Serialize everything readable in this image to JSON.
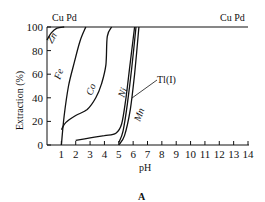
{
  "chart_data": {
    "type": "line",
    "title": "",
    "panel_label": "A",
    "xlabel": "pH",
    "ylabel": "Extraction (%)",
    "xlim": [
      0,
      14
    ],
    "ylim": [
      0,
      100
    ],
    "x_ticks": [
      "1",
      "2",
      "3",
      "4",
      "5",
      "6",
      "7",
      "8",
      "9",
      "10",
      "11",
      "12",
      "13",
      "14"
    ],
    "y_ticks": [
      "0",
      "20",
      "40",
      "60",
      "80",
      "100"
    ],
    "grid": false,
    "legend": "inline labels",
    "top_labels": [
      "Cu Pd",
      "Cu Pd"
    ],
    "series": [
      {
        "name": "Cu Pd",
        "points": [
          [
            0,
            100
          ],
          [
            14,
            100
          ]
        ]
      },
      {
        "name": "Zn",
        "points": [
          [
            0,
            89
          ],
          [
            0.3,
            95
          ],
          [
            0.7,
            99
          ],
          [
            1.2,
            100
          ]
        ]
      },
      {
        "name": "Fe",
        "points": [
          [
            1,
            0
          ],
          [
            1.2,
            25
          ],
          [
            1.5,
            50
          ],
          [
            1.9,
            70
          ],
          [
            2.3,
            88
          ],
          [
            2.7,
            100
          ]
        ]
      },
      {
        "name": "Co",
        "points": [
          [
            1,
            13
          ],
          [
            1.3,
            19
          ],
          [
            2,
            25
          ],
          [
            2.8,
            30
          ],
          [
            3.4,
            40
          ],
          [
            3.8,
            52
          ],
          [
            4.1,
            68
          ],
          [
            4.2,
            92
          ],
          [
            4.5,
            100
          ]
        ]
      },
      {
        "name": "Ni",
        "points": [
          [
            2,
            4
          ],
          [
            3,
            6
          ],
          [
            4,
            8
          ],
          [
            4.8,
            10
          ],
          [
            5.2,
            18
          ],
          [
            5.5,
            40
          ],
          [
            5.8,
            70
          ],
          [
            6.1,
            100
          ]
        ]
      },
      {
        "name": "Tl(I)",
        "points": [
          [
            5,
            2
          ],
          [
            5.3,
            12
          ],
          [
            5.6,
            35
          ],
          [
            5.9,
            65
          ],
          [
            6.2,
            100
          ]
        ]
      },
      {
        "name": "Mn",
        "points": [
          [
            5,
            0
          ],
          [
            5.4,
            8
          ],
          [
            5.8,
            30
          ],
          [
            6.1,
            60
          ],
          [
            6.4,
            100
          ]
        ]
      }
    ],
    "annotations": [
      "Zn",
      "Fe",
      "Co",
      "Ni",
      "Tl(I)",
      "Mn"
    ]
  }
}
